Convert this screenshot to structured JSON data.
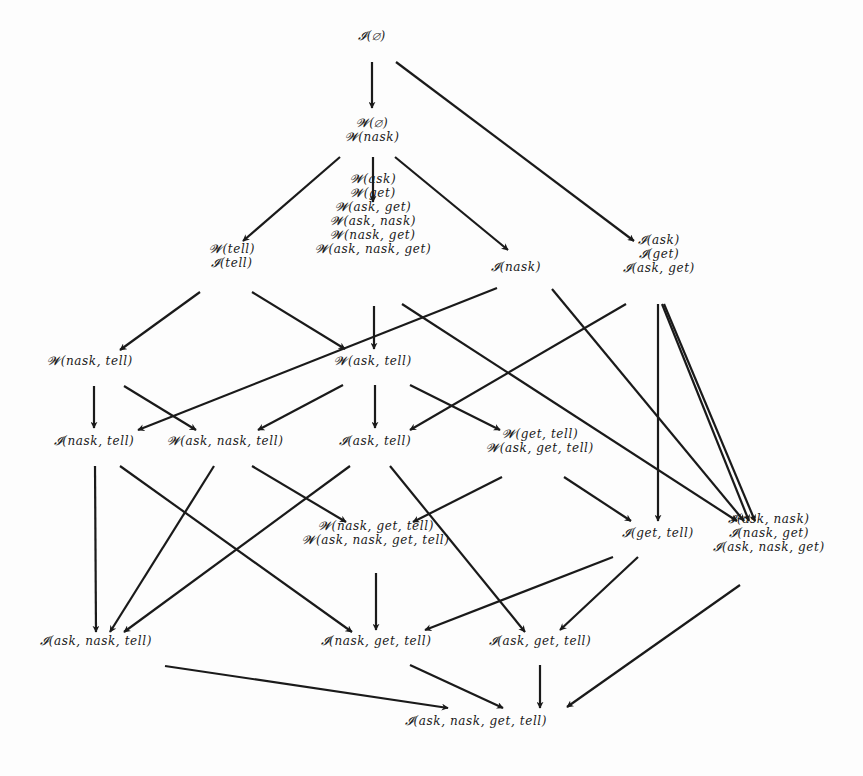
{
  "diagram": {
    "title": "",
    "stroke_color": "#1a1a1a",
    "background": "#fdfdfd",
    "nodes": [
      {
        "id": "n0",
        "x": 372,
        "y": 36,
        "lines": [
          "𝓘(∅)"
        ]
      },
      {
        "id": "n1",
        "x": 372,
        "y": 130,
        "lines": [
          "𝓦(∅)",
          "𝓦(nask)"
        ]
      },
      {
        "id": "n2",
        "x": 232,
        "y": 256,
        "lines": [
          "𝓦(tell)",
          "𝓘(tell)"
        ]
      },
      {
        "id": "n3",
        "x": 373,
        "y": 214,
        "lines": [
          "𝓦(ask)",
          "𝓦(get)",
          "𝓦(ask, get)",
          "𝓦(ask, nask)",
          "𝓦(nask, get)",
          "𝓦(ask, nask, get)"
        ]
      },
      {
        "id": "n4",
        "x": 516,
        "y": 267,
        "lines": [
          "𝓘(nask)"
        ]
      },
      {
        "id": "n5",
        "x": 659,
        "y": 254,
        "lines": [
          "𝓘(ask)",
          "𝓘(get)",
          "𝓘(ask, get)"
        ]
      },
      {
        "id": "n6",
        "x": 90,
        "y": 361,
        "lines": [
          "𝓦(nask, tell)"
        ]
      },
      {
        "id": "n7",
        "x": 373,
        "y": 361,
        "lines": [
          "𝓦(ask, tell)"
        ]
      },
      {
        "id": "n8",
        "x": 94,
        "y": 441,
        "lines": [
          "𝓘(nask, tell)"
        ]
      },
      {
        "id": "n9",
        "x": 225,
        "y": 441,
        "lines": [
          "𝓦(ask, nask, tell)"
        ]
      },
      {
        "id": "n10",
        "x": 375,
        "y": 441,
        "lines": [
          "𝓘(ask, tell)"
        ]
      },
      {
        "id": "n11",
        "x": 540,
        "y": 441,
        "lines": [
          "𝓦(get, tell)",
          "𝓦(ask, get, tell)"
        ]
      },
      {
        "id": "n12",
        "x": 376,
        "y": 533,
        "lines": [
          "𝓦(nask, get, tell)",
          "𝓦(ask, nask, get, tell)"
        ]
      },
      {
        "id": "n13",
        "x": 658,
        "y": 533,
        "lines": [
          "𝓘(get, tell)"
        ]
      },
      {
        "id": "n14",
        "x": 769,
        "y": 533,
        "lines": [
          "𝓘(ask, nask)",
          "𝓘(nask, get)",
          "𝓘(ask, nask, get)"
        ]
      },
      {
        "id": "n15",
        "x": 96,
        "y": 641,
        "lines": [
          "𝓘(ask, nask, tell)"
        ]
      },
      {
        "id": "n16",
        "x": 376,
        "y": 641,
        "lines": [
          "𝓘(nask, get, tell)"
        ]
      },
      {
        "id": "n17",
        "x": 540,
        "y": 641,
        "lines": [
          "𝓘(ask, get, tell)"
        ]
      },
      {
        "id": "n18",
        "x": 476,
        "y": 721,
        "lines": [
          "𝓘(ask, nask, get, tell)"
        ]
      }
    ],
    "edges": [
      {
        "from": "n0",
        "to": "n1",
        "x1": 372,
        "y1": 62,
        "x2": 372,
        "y2": 108
      },
      {
        "from": "n0",
        "to": "n5",
        "x1": 396,
        "y1": 62,
        "x2": 634,
        "y2": 241
      },
      {
        "from": "n1",
        "to": "n2",
        "x1": 340,
        "y1": 157,
        "x2": 243,
        "y2": 241
      },
      {
        "from": "n1",
        "to": "n3",
        "x1": 373,
        "y1": 157,
        "x2": 373,
        "y2": 202
      },
      {
        "from": "n1",
        "to": "n4",
        "x1": 395,
        "y1": 157,
        "x2": 508,
        "y2": 250
      },
      {
        "from": "n2",
        "to": "n6",
        "x1": 200,
        "y1": 292,
        "x2": 120,
        "y2": 350
      },
      {
        "from": "n2",
        "to": "n7",
        "x1": 252,
        "y1": 292,
        "x2": 345,
        "y2": 349
      },
      {
        "from": "n3",
        "to": "n7",
        "x1": 374,
        "y1": 306,
        "x2": 374,
        "y2": 349
      },
      {
        "from": "n3",
        "to": "n14",
        "x1": 402,
        "y1": 304,
        "x2": 737,
        "y2": 521
      },
      {
        "from": "n4",
        "to": "n8",
        "x1": 497,
        "y1": 288,
        "x2": 138,
        "y2": 430
      },
      {
        "from": "n4",
        "to": "n14",
        "x1": 552,
        "y1": 289,
        "x2": 744,
        "y2": 521
      },
      {
        "from": "n5",
        "to": "n10",
        "x1": 626,
        "y1": 304,
        "x2": 410,
        "y2": 430
      },
      {
        "from": "n5",
        "to": "n13",
        "x1": 658,
        "y1": 304,
        "x2": 658,
        "y2": 521
      },
      {
        "from": "n5",
        "to": "n14",
        "x1": 664,
        "y1": 304,
        "x2": 755,
        "y2": 521
      },
      {
        "from": "n5",
        "to": "n14b",
        "x1": 662,
        "y1": 304,
        "x2": 749,
        "y2": 521
      },
      {
        "from": "n6",
        "to": "n8",
        "x1": 94,
        "y1": 386,
        "x2": 94,
        "y2": 428
      },
      {
        "from": "n6",
        "to": "n9",
        "x1": 124,
        "y1": 386,
        "x2": 196,
        "y2": 430
      },
      {
        "from": "n7",
        "to": "n9",
        "x1": 343,
        "y1": 385,
        "x2": 258,
        "y2": 430
      },
      {
        "from": "n7",
        "to": "n10",
        "x1": 375,
        "y1": 385,
        "x2": 375,
        "y2": 428
      },
      {
        "from": "n7",
        "to": "n11",
        "x1": 410,
        "y1": 385,
        "x2": 500,
        "y2": 430
      },
      {
        "from": "n8",
        "to": "n15",
        "x1": 95,
        "y1": 466,
        "x2": 96,
        "y2": 632
      },
      {
        "from": "n8",
        "to": "n16",
        "x1": 120,
        "y1": 466,
        "x2": 352,
        "y2": 632
      },
      {
        "from": "n9",
        "to": "n15",
        "x1": 214,
        "y1": 466,
        "x2": 110,
        "y2": 632
      },
      {
        "from": "n9",
        "to": "n12",
        "x1": 252,
        "y1": 466,
        "x2": 346,
        "y2": 522
      },
      {
        "from": "n10",
        "to": "n15",
        "x1": 350,
        "y1": 466,
        "x2": 124,
        "y2": 632
      },
      {
        "from": "n10",
        "to": "n17",
        "x1": 390,
        "y1": 466,
        "x2": 525,
        "y2": 632
      },
      {
        "from": "n11",
        "to": "n12",
        "x1": 502,
        "y1": 477,
        "x2": 413,
        "y2": 522
      },
      {
        "from": "n11",
        "to": "n13",
        "x1": 564,
        "y1": 477,
        "x2": 631,
        "y2": 521
      },
      {
        "from": "n12",
        "to": "n16",
        "x1": 376,
        "y1": 573,
        "x2": 376,
        "y2": 630
      },
      {
        "from": "n13",
        "to": "n16",
        "x1": 613,
        "y1": 557,
        "x2": 425,
        "y2": 630
      },
      {
        "from": "n13",
        "to": "n17",
        "x1": 638,
        "y1": 557,
        "x2": 560,
        "y2": 630
      },
      {
        "from": "n14",
        "to": "n18",
        "x1": 740,
        "y1": 585,
        "x2": 567,
        "y2": 707
      },
      {
        "from": "n15",
        "to": "n18",
        "x1": 165,
        "y1": 666,
        "x2": 448,
        "y2": 708
      },
      {
        "from": "n16",
        "to": "n18",
        "x1": 410,
        "y1": 665,
        "x2": 503,
        "y2": 708
      },
      {
        "from": "n17",
        "to": "n18",
        "x1": 540,
        "y1": 665,
        "x2": 540,
        "y2": 708
      }
    ]
  }
}
